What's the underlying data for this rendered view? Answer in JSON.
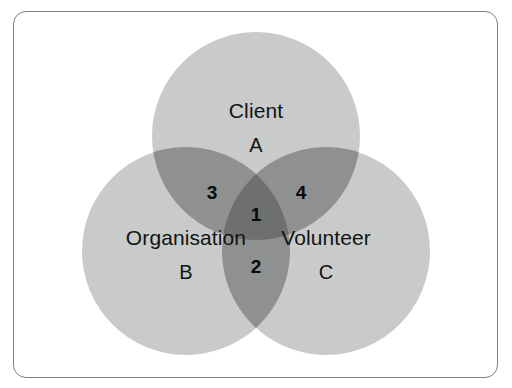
{
  "figure": {
    "type": "venn-diagram",
    "set_count": 3,
    "background_color": "#ffffff",
    "border_color": "#7b7f80",
    "circle_fill_color": "#c9cbcb",
    "pair_overlap_color": "#8f9191",
    "triple_overlap_color": "#6e7070",
    "label_text_color": "#111314",
    "number_text_color": "#08090a"
  },
  "sets": [
    {
      "id": "A",
      "title": "Client",
      "letter": "A",
      "position": "top",
      "center_x": 256,
      "center_y": 136,
      "radius": 104
    },
    {
      "id": "B",
      "title": "Organisation",
      "letter": "B",
      "position": "bottom-left",
      "center_x": 186,
      "center_y": 251,
      "radius": 104
    },
    {
      "id": "C",
      "title": "Volunteer",
      "letter": "C",
      "position": "bottom-right",
      "center_x": 326,
      "center_y": 251,
      "radius": 104
    }
  ],
  "regions": [
    {
      "number": "1",
      "sets": "A∩B∩C",
      "center_x": 256,
      "center_y": 214,
      "shade": "triple"
    },
    {
      "number": "2",
      "sets": "B∩C",
      "center_x": 256,
      "center_y": 266,
      "shade": "pair"
    },
    {
      "number": "3",
      "sets": "A∩B",
      "center_x": 212,
      "center_y": 192,
      "shade": "pair"
    },
    {
      "number": "4",
      "sets": "A∩C",
      "center_x": 301,
      "center_y": 192,
      "shade": "pair"
    }
  ],
  "chart_data": {
    "type": "venn",
    "title": "",
    "categories": [
      "Client",
      "Organisation",
      "Volunteer"
    ],
    "set_letters": [
      "A",
      "B",
      "C"
    ],
    "region_labels": {
      "A∩B∩C": "1",
      "B∩C": "2",
      "A∩B": "3",
      "A∩C": "4"
    },
    "legend": "none",
    "grid": false
  }
}
